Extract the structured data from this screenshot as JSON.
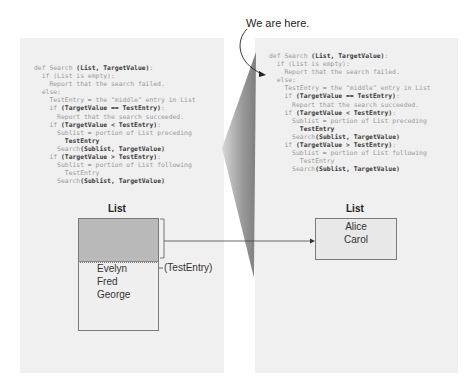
{
  "annotation": {
    "label": "We are here."
  },
  "left_panel": {
    "code": [
      {
        "indent": 0,
        "parts": [
          {
            "t": "def Search ",
            "b": false
          },
          {
            "t": "(List, TargetValue)",
            "b": true
          },
          {
            "t": ":",
            "b": false
          }
        ]
      },
      {
        "indent": 1,
        "parts": [
          {
            "t": "if (List is empty):",
            "b": false
          }
        ]
      },
      {
        "indent": 2,
        "parts": [
          {
            "t": "Report that the search failed.",
            "b": false
          }
        ]
      },
      {
        "indent": 1,
        "parts": [
          {
            "t": "else:",
            "b": false
          }
        ]
      },
      {
        "indent": 2,
        "parts": [
          {
            "t": "TestEntry = the \"middle\" entry in List",
            "b": false
          }
        ]
      },
      {
        "indent": 2,
        "parts": [
          {
            "t": "if ",
            "b": false
          },
          {
            "t": "(TargetValue == TestEntry)",
            "b": true
          },
          {
            "t": ":",
            "b": false
          }
        ]
      },
      {
        "indent": 3,
        "parts": [
          {
            "t": "Report that the search succeeded.",
            "b": false
          }
        ]
      },
      {
        "indent": 2,
        "parts": [
          {
            "t": "if ",
            "b": false
          },
          {
            "t": "(TargetValue < TestEntry)",
            "b": true
          },
          {
            "t": ":",
            "b": false
          }
        ]
      },
      {
        "indent": 3,
        "parts": [
          {
            "t": "Sublist = portion of List preceding",
            "b": false
          }
        ]
      },
      {
        "indent": 4,
        "parts": [
          {
            "t": "TestEntry",
            "b": true
          }
        ]
      },
      {
        "indent": 3,
        "parts": [
          {
            "t": "Search",
            "b": false
          },
          {
            "t": "(Sublist, TargetValue)",
            "b": true
          }
        ]
      },
      {
        "indent": 2,
        "parts": [
          {
            "t": "if ",
            "b": false
          },
          {
            "t": "(TargetValue > TestEntry)",
            "b": true
          },
          {
            "t": ":",
            "b": false
          }
        ]
      },
      {
        "indent": 3,
        "parts": [
          {
            "t": "Sublist = portion of List following",
            "b": false
          }
        ]
      },
      {
        "indent": 4,
        "parts": [
          {
            "t": "TestEntry",
            "b": false
          }
        ]
      },
      {
        "indent": 3,
        "parts": [
          {
            "t": "Search",
            "b": false
          },
          {
            "t": "(Sublist, TargetValue)",
            "b": true
          }
        ]
      }
    ],
    "list_title": "List",
    "list_items": [
      "Evelyn",
      "Fred",
      "George"
    ],
    "test_entry_label": "(TestEntry)"
  },
  "right_panel": {
    "list_title": "List",
    "list_items": [
      "Alice",
      "Carol"
    ]
  },
  "colors": {
    "panel_bg": "#f0f0f0",
    "shaded_region": "#b9b9b9",
    "wedge": "#8c8c8c",
    "line": "#555555"
  }
}
